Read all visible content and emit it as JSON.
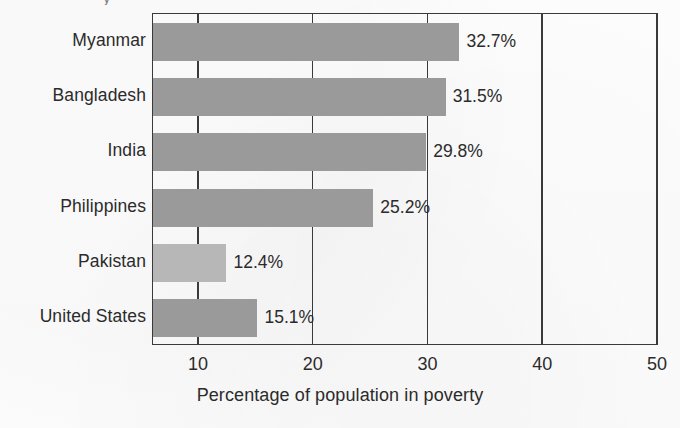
{
  "figure": {
    "title_remnant": "y",
    "background_color": "#fdfdfd",
    "frame_color": "#3a3a3a",
    "bar_color": "#9a9a9a",
    "bar_color_light": "#b7b7b7",
    "text_color": "#2b2b2b"
  },
  "chart_data": {
    "type": "bar",
    "orientation": "horizontal",
    "title": "",
    "xlabel": "Percentage of population in poverty",
    "ylabel": "",
    "categories": [
      "Myanmar",
      "Bangladesh",
      "India",
      "Philippines",
      "Pakistan",
      "United States"
    ],
    "values": [
      32.7,
      31.5,
      29.8,
      25.2,
      12.4,
      15.1
    ],
    "value_labels": [
      "32.7%",
      "31.5%",
      "29.8%",
      "25.2%",
      "12.4%",
      "15.1%"
    ],
    "bar_shades": [
      "dark",
      "dark",
      "dark",
      "dark",
      "light",
      "dark"
    ],
    "xlim": [
      6,
      50
    ],
    "axis_starts_at": 6,
    "xticks": [
      10,
      20,
      30,
      40,
      50
    ],
    "xtick_labels": [
      "10",
      "20",
      "30",
      "40",
      "50"
    ],
    "grid": true,
    "grid_orientation": "vertical",
    "legend": "none"
  }
}
